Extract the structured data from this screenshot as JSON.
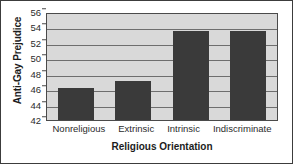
{
  "chart_data": {
    "type": "bar",
    "title": "",
    "xlabel": "Religious Orientation",
    "ylabel": "Anti-Gay Prejudice",
    "categories": [
      "Nonreligious",
      "Extrinsic",
      "Intrinsic",
      "Indiscriminate"
    ],
    "values": [
      46.1,
      47.1,
      53.6,
      53.5
    ],
    "ylim": [
      42,
      56
    ],
    "yticks": [
      42,
      44,
      46,
      48,
      50,
      52,
      54,
      56
    ],
    "ytick_labels": [
      "42",
      "44",
      "46",
      "48",
      "50",
      "52",
      "54",
      "56"
    ],
    "grid": true,
    "legend": false,
    "colors": {
      "bar": "#3a3a3a",
      "plot_background": "#d9d9d9",
      "figure_background": "#ffffff",
      "gridline": "#6e6e6e",
      "axis": "#4a4a4a",
      "text": "#1c1c1c"
    }
  }
}
